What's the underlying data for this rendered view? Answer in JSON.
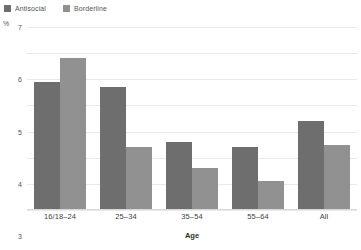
{
  "chart_data": {
    "type": "bar",
    "title": "",
    "subtitle": "",
    "xlabel": "Age",
    "ylabel": "%",
    "categories": [
      "16/18–24",
      "25–34",
      "35–54",
      "55–64",
      "All"
    ],
    "series": [
      {
        "name": "Antisocial",
        "color": "#6e6e6e",
        "values": [
          4.9,
          4.7,
          2.6,
          2.4,
          3.4
        ]
      },
      {
        "name": "Borderline",
        "color": "#919191",
        "values": [
          5.8,
          2.4,
          1.6,
          1.1,
          2.5
        ]
      }
    ],
    "ylim": [
      0,
      7
    ],
    "yticks": [
      7,
      6,
      5,
      4,
      3,
      2,
      1,
      0
    ],
    "grid": true,
    "legend_position": "top-left",
    "annotations": []
  },
  "legend": {
    "items": [
      {
        "label": "Antisocial",
        "color": "#6e6e6e"
      },
      {
        "label": "Borderline",
        "color": "#919191"
      }
    ]
  },
  "axes": {
    "y_unit_label": "%",
    "x_title": "Age"
  }
}
